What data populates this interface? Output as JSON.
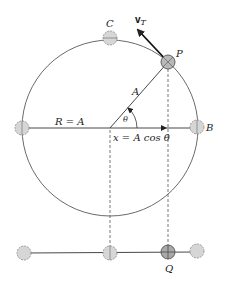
{
  "figure": {
    "type": "uniform circular motion projection diagram",
    "colors": {
      "line": "#333333",
      "dashed": "#555555",
      "ball_fill": "#d6d6d6",
      "ball_fill_dark": "#a8a8a8",
      "ball_stroke": "#888888"
    }
  },
  "labels": {
    "C": "C",
    "P": "P",
    "B": "B",
    "Q": "Q",
    "vT_main": "v",
    "vT_sub": "T",
    "radius": "R = A",
    "hypotenuse": "A",
    "angle": "θ",
    "projection": "x = A cos θ"
  }
}
